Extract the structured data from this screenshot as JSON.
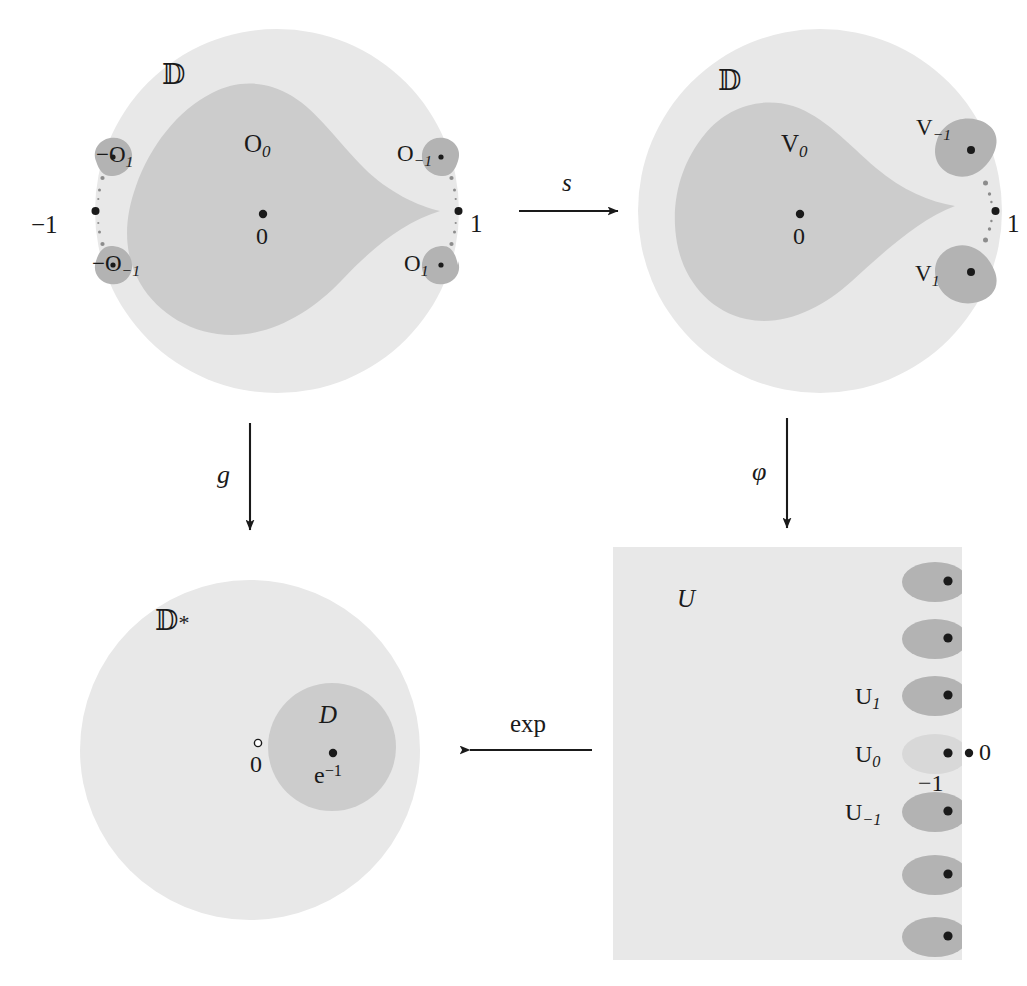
{
  "figure": {
    "type": "commutative-diagram",
    "colors": {
      "background": "#ffffff",
      "outer_disk": "#e8e8e8",
      "mid_region": "#cccccc",
      "blob": "#b3b3b3",
      "blob_light": "#d8d8d8",
      "ink": "#1a1a1a"
    }
  },
  "panels": {
    "top_left": {
      "name": "disk-O",
      "outer_label": "𝔻",
      "center_region_label": "O",
      "center_region_sub": "0",
      "center_point_label": "0",
      "left_boundary_label": "−1",
      "right_boundary_label": "1",
      "blobs": [
        {
          "label": "−O",
          "sub": "1",
          "position": "upper-left"
        },
        {
          "label": "−O",
          "sub": "−1",
          "position": "lower-left"
        },
        {
          "label": "O",
          "sub": "−1",
          "position": "upper-right"
        },
        {
          "label": "O",
          "sub": "1",
          "position": "lower-right"
        }
      ]
    },
    "top_right": {
      "name": "disk-V",
      "outer_label": "𝔻",
      "center_region_label": "V",
      "center_region_sub": "0",
      "center_point_label": "0",
      "right_boundary_label": "1",
      "blobs": [
        {
          "label": "V",
          "sub": "−1",
          "position": "upper-right"
        },
        {
          "label": "V",
          "sub": "1",
          "position": "lower-right"
        }
      ]
    },
    "bottom_left": {
      "name": "punctured-disk",
      "outer_label": "𝔻",
      "outer_label_star": "*",
      "origin_label": "0",
      "inner_region_label": "D",
      "inner_point_label": "e",
      "inner_point_exp": "−1"
    },
    "bottom_right": {
      "name": "strip-U",
      "region_label": "U",
      "blobs": [
        {
          "label": "",
          "sub": ""
        },
        {
          "label": "",
          "sub": ""
        },
        {
          "label": "U",
          "sub": "1"
        },
        {
          "label": "U",
          "sub": "0"
        },
        {
          "label": "U",
          "sub": "−1"
        },
        {
          "label": "",
          "sub": ""
        },
        {
          "label": "",
          "sub": ""
        }
      ],
      "point_zero_label": "0",
      "point_minus_one_label": "−1"
    }
  },
  "arrows": {
    "top": {
      "name": "arrow-s",
      "label": "s",
      "style": "italic",
      "direction": "right"
    },
    "left": {
      "name": "arrow-g",
      "label": "g",
      "style": "italic",
      "direction": "down"
    },
    "right": {
      "name": "arrow-phi",
      "label": "φ",
      "style": "italic",
      "direction": "down"
    },
    "bottom": {
      "name": "arrow-exp",
      "label": "exp",
      "style": "upright",
      "direction": "left"
    }
  }
}
